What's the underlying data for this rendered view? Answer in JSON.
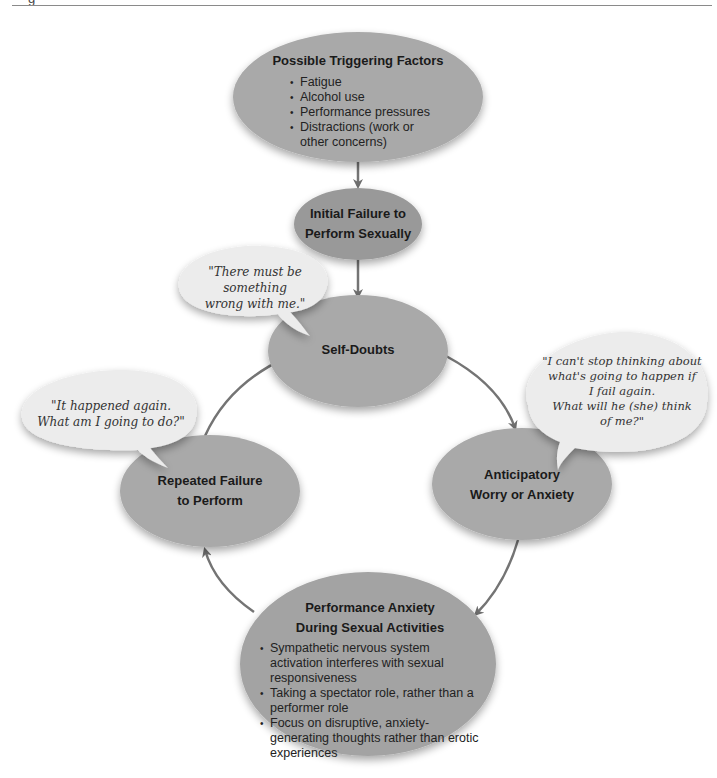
{
  "page": {
    "caption_fragment": "g"
  },
  "colors": {
    "node_fill": "#a9a9a9",
    "node_fill_dark": "#999999",
    "bubble_fill": "#ececec",
    "arrow": "#707070",
    "text": "#1a1a1a"
  },
  "nodes": {
    "triggering": {
      "title": "Possible Triggering Factors",
      "items": [
        "Fatigue",
        "Alcohol use",
        "Performance pressures",
        "Distractions (work or other concerns)"
      ]
    },
    "initial_failure": {
      "title_line1": "Initial Failure to",
      "title_line2": "Perform Sexually"
    },
    "self_doubts": {
      "title": "Self-Doubts"
    },
    "anticipatory": {
      "title_line1": "Anticipatory",
      "title_line2": "Worry or Anxiety"
    },
    "performance_anxiety": {
      "title_line1": "Performance Anxiety",
      "title_line2": "During Sexual Activities",
      "items": [
        "Sympathetic nervous system activation interferes with sexual responsiveness",
        "Taking a spectator role, rather than a performer role",
        "Focus on disruptive, anxiety-generating thoughts rather than erotic experiences"
      ]
    },
    "repeated_failure": {
      "title_line1": "Repeated Failure",
      "title_line2": "to Perform"
    }
  },
  "bubbles": {
    "self_doubts": {
      "line1": "\"There must be something",
      "line2": "wrong with me.\""
    },
    "anticipatory": {
      "line1": "\"I can't stop thinking about",
      "line2": "what's going to happen if",
      "line3": "I fail again.",
      "line4": "What will he (she) think",
      "line5": "of me?\""
    },
    "repeated": {
      "line1": "\"It happened again.",
      "line2": "What am I going to do?\""
    }
  }
}
